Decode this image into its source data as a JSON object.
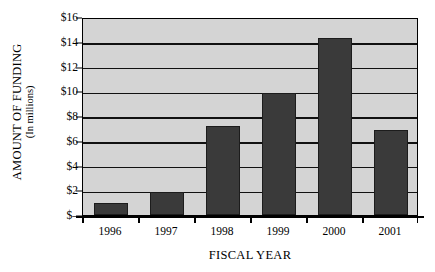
{
  "chart_data": {
    "type": "bar",
    "title": "",
    "xlabel": "FISCAL YEAR",
    "ylabel": "AMOUNT OF FUNDING",
    "ylabel_sub": "(In millions)",
    "categories": [
      "1996",
      "1997",
      "1998",
      "1999",
      "2000",
      "2001"
    ],
    "values": [
      1.0,
      1.9,
      7.2,
      9.9,
      14.3,
      6.9
    ],
    "ylim": [
      0,
      16
    ],
    "ytick_values": [
      0,
      2,
      4,
      6,
      8,
      10,
      12,
      14,
      16
    ],
    "ytick_labels": [
      "$–",
      "$2",
      "$4",
      "$6",
      "$8",
      "$10",
      "$12",
      "$14",
      "$16"
    ],
    "grid": true,
    "grid_axis": "y",
    "legend": "none",
    "colors": {
      "bar_fill": "#3a3a3a",
      "bar_edge": "#1c1c1c",
      "plot_background": "#d4d4d4",
      "page_background": "#ffffff",
      "axis": "#000000",
      "gridline": "#111111",
      "text": "#000000"
    }
  }
}
